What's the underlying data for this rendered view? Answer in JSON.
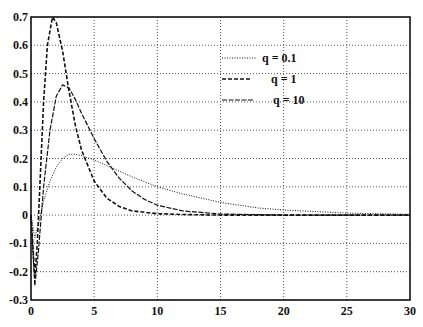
{
  "chart_data": {
    "type": "line",
    "title": "",
    "xlabel": "",
    "ylabel": "",
    "xlim": [
      0,
      30
    ],
    "ylim": [
      -0.3,
      0.7
    ],
    "grid": true,
    "legend_position": "upper right (inside)",
    "x_ticks": [
      "0",
      "5",
      "10",
      "15",
      "20",
      "25",
      "30"
    ],
    "y_ticks": [
      "0.7",
      "0.6",
      "0.5",
      "0.4",
      "0.3",
      "0.2",
      "0.1",
      "0",
      "-0.1",
      "-0.2",
      "-0.3"
    ],
    "series": [
      {
        "name": "q = 0.1",
        "style": "dotted",
        "x": [
          0,
          0.3,
          0.6,
          1,
          1.5,
          2,
          2.5,
          3,
          3.5,
          4,
          5,
          6,
          7,
          8,
          10,
          12,
          15,
          18,
          20,
          25,
          30
        ],
        "y": [
          0,
          -0.08,
          -0.03,
          0.05,
          0.12,
          0.17,
          0.2,
          0.215,
          0.215,
          0.21,
          0.195,
          0.175,
          0.155,
          0.135,
          0.1,
          0.075,
          0.045,
          0.025,
          0.018,
          0.007,
          0.003
        ]
      },
      {
        "name": "q = 1",
        "style": "dashed",
        "x": [
          0,
          0.3,
          0.5,
          0.8,
          1,
          1.3,
          1.7,
          2,
          2.5,
          3,
          3.5,
          4,
          5,
          6,
          7,
          8,
          10,
          12,
          15,
          20,
          30
        ],
        "y": [
          0,
          -0.22,
          -0.1,
          0.2,
          0.4,
          0.6,
          0.7,
          0.68,
          0.58,
          0.44,
          0.32,
          0.23,
          0.12,
          0.06,
          0.03,
          0.015,
          0.005,
          0.002,
          0.0,
          0.0,
          0.0
        ]
      },
      {
        "name": "q = 10",
        "style": "dash-dot",
        "x": [
          0,
          0.3,
          0.6,
          1,
          1.5,
          2,
          2.5,
          3,
          3.5,
          4,
          5,
          6,
          7,
          8,
          9,
          10,
          12,
          15,
          20,
          30
        ],
        "y": [
          0,
          -0.25,
          -0.12,
          0.1,
          0.3,
          0.42,
          0.46,
          0.45,
          0.41,
          0.36,
          0.27,
          0.19,
          0.13,
          0.085,
          0.055,
          0.035,
          0.015,
          0.004,
          0.0,
          0.0
        ]
      }
    ]
  }
}
